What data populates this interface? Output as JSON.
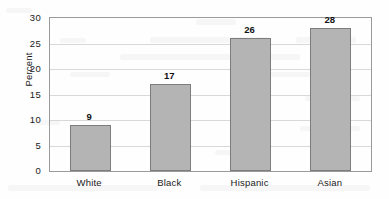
{
  "chart_data": {
    "type": "bar",
    "title": "",
    "subtitle": "",
    "xlabel": "",
    "ylabel": "Percent",
    "categories": [
      "White",
      "Black",
      "Hispanic",
      "Asian"
    ],
    "values": [
      9,
      17,
      26,
      28
    ],
    "value_labels": [
      "9",
      "17",
      "26",
      "28"
    ],
    "ylim": [
      0,
      30
    ],
    "yticks": [
      0,
      5,
      10,
      15,
      20,
      25,
      30
    ],
    "ytick_labels": [
      "0",
      "5",
      "10",
      "15",
      "20",
      "25",
      "30"
    ],
    "grid": "horizontal",
    "legend": "none",
    "series": [
      {
        "name": "Percent",
        "values": [
          9,
          17,
          26,
          28
        ]
      }
    ],
    "colors": {
      "bar_fill": "#b4b4b4",
      "bar_border": "#7d7d7d",
      "gridline": "#d8d8d8",
      "frame": "#9a9a9a",
      "text": "#1a1a1a",
      "background": "#fefefe"
    }
  }
}
